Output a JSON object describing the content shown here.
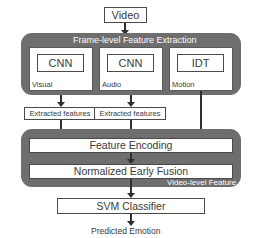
{
  "diagram": {
    "colors": {
      "panel_gray": "#6e6e6e",
      "box_border": "#4a4a4a",
      "arrow": "#2f2f2f",
      "text_dark": "#3a3a3a",
      "text_light": "#ffffff",
      "background": "#ffffff"
    },
    "input": {
      "label": "Video"
    },
    "frame_level_panel": {
      "title": "Frame-level Feature Extraction",
      "branches": [
        {
          "model": "CNN",
          "modality": "Visual",
          "intermediate": "Extracted features"
        },
        {
          "model": "CNN",
          "modality": "Audio",
          "intermediate": "Extracted features"
        },
        {
          "model": "IDT",
          "modality": "Motion",
          "intermediate": ""
        }
      ]
    },
    "video_level_panel": {
      "title": "Video-level Feature",
      "stages": [
        {
          "label": "Feature Encoding"
        },
        {
          "label": "Normalized Early Fusion"
        }
      ]
    },
    "classifier": {
      "label": "SVM Classifier"
    },
    "output": {
      "label": "Predicted Emotion"
    }
  }
}
